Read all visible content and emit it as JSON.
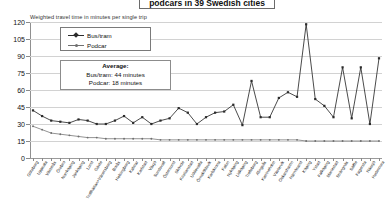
{
  "title": "podcars in 39 Swedish cities",
  "subtitle": "Weighted travel time in minutes per single trip",
  "legend": {
    "items": [
      {
        "label": "Bus/tram",
        "color": "#2b2b2b",
        "marker": "diamond-marker"
      },
      {
        "label": "Podcar",
        "color": "#6f6f6f",
        "marker": "dot-marker"
      }
    ]
  },
  "annotation": {
    "heading": "Average:",
    "line1": "Bus/tram: 44 minutes",
    "line2": "Podcar: 18 minutes"
  },
  "chart_data": {
    "type": "line",
    "title": "podcars in 39 Swedish cities",
    "subtitle": "Weighted travel time in minutes per single trip",
    "xlabel": "",
    "ylabel": "Weighted travel time in minutes per single trip",
    "ylim": [
      0,
      120
    ],
    "yticks": [
      0,
      15,
      30,
      45,
      60,
      75,
      90,
      105,
      120
    ],
    "grid": true,
    "legend_position": "top-left-inset",
    "categories": [
      "Göteborg",
      "Uppsala",
      "Västerås",
      "Örebro",
      "Norrköping",
      "Jönköping",
      "Lund",
      "Gävle",
      "Trollhättan+Vänersborg",
      "Borås",
      "Helsingborg",
      "Kalmar",
      "Karlstad",
      "Växjö",
      "Sundsvall",
      "Östersund",
      "Skövde",
      "Kristianstad",
      "Uddevalla",
      "Örnsköldsvik",
      "Karlskrona",
      "Falun",
      "Nyköping",
      "Lidköping",
      "Trelleborg",
      "Alingsås",
      "Katrineholm",
      "Västervik",
      "Oskarshamn",
      "Härnösand",
      "Köping",
      "Ystad",
      "Falköping",
      "Mariestad",
      "Strängnäs",
      "Säffle",
      "Fagersta",
      "Nässjö",
      "Hedemora"
    ],
    "series": [
      {
        "name": "Bus/tram",
        "color": "#2b2b2b",
        "values": [
          42,
          37,
          33,
          32,
          31,
          34,
          33,
          30,
          30,
          33,
          37,
          31,
          36,
          30,
          33,
          35,
          44,
          40,
          30,
          36,
          40,
          41,
          47,
          29,
          68,
          36,
          36,
          53,
          58,
          54,
          118,
          52,
          46,
          36,
          80,
          35,
          80,
          30,
          88
        ]
      },
      {
        "name": "Podcar",
        "color": "#6f6f6f",
        "values": [
          28,
          25,
          22,
          21,
          20,
          19,
          18,
          18,
          17,
          17,
          17,
          17,
          17,
          17,
          16,
          16,
          16,
          16,
          16,
          16,
          16,
          16,
          16,
          16,
          16,
          16,
          16,
          16,
          16,
          16,
          15,
          15,
          15,
          15,
          15,
          15,
          15,
          15,
          15
        ]
      }
    ],
    "averages": {
      "Bus/tram": 44,
      "Podcar": 18
    }
  }
}
